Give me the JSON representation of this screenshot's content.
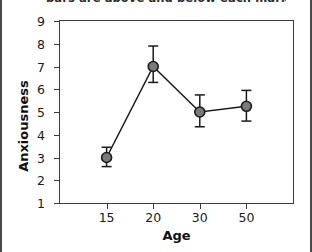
{
  "caption": "bars are above and below each marker",
  "chart_data": {
    "type": "line",
    "title": "",
    "xlabel": "Age",
    "ylabel": "Anxiousness",
    "categories": [
      "15",
      "20",
      "30",
      "50"
    ],
    "x": [
      15,
      20,
      30,
      50
    ],
    "values": [
      3.0,
      7.0,
      5.0,
      5.25
    ],
    "errors_upper": [
      3.45,
      7.9,
      5.75,
      5.95
    ],
    "errors_lower": [
      2.6,
      6.3,
      4.35,
      4.6
    ],
    "error_bars": true,
    "xlim": [
      0,
      5
    ],
    "ylim": [
      1,
      9
    ],
    "yticks": [
      1,
      2,
      3,
      4,
      5,
      6,
      7,
      8,
      9
    ],
    "ytick_labels": [
      "1",
      "2",
      "3",
      "4",
      "5",
      "6",
      "7",
      "8",
      "9"
    ],
    "xtick_labels": [
      "15",
      "20",
      "30",
      "50"
    ],
    "grid": false,
    "legend": "none",
    "marker": "circle",
    "marker_color": "#7a7a7a",
    "marker_edge_color": "#1a1a1a",
    "line_color": "#1a1a1a",
    "error_bar_color": "#1a1a1a",
    "axis_color": "#3b3b3b",
    "background_color": "#ffffff"
  }
}
